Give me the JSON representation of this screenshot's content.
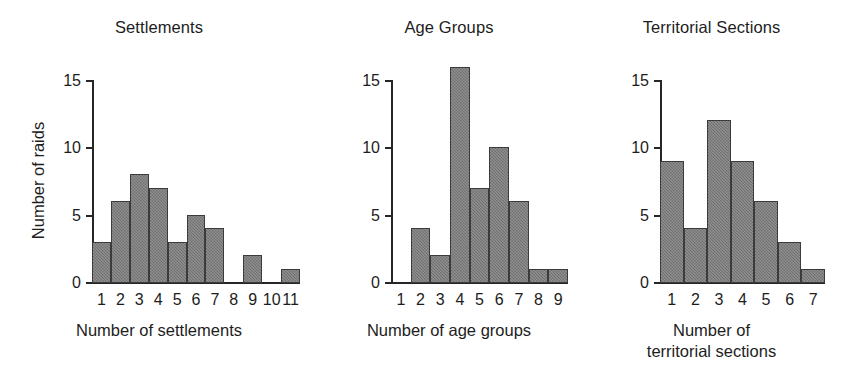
{
  "figure": {
    "background": "#ffffff",
    "bar_fill": "#7b7b7b",
    "bar_stroke": "#3b3b3b",
    "axis_color": "#262626",
    "text_color": "#1d1d1d"
  },
  "chart_data": [
    {
      "type": "bar",
      "title": "Settlements",
      "xlabel": "Number of settlements",
      "ylabel": "Number of raids",
      "categories": [
        "1",
        "2",
        "3",
        "4",
        "5",
        "6",
        "7",
        "8",
        "9",
        "10",
        "11"
      ],
      "values": [
        3,
        6,
        8,
        7,
        3,
        5,
        4,
        0,
        2,
        0,
        1
      ],
      "ylim": [
        0,
        15
      ],
      "yticks": [
        0,
        5,
        10,
        15
      ],
      "ytick_labels": [
        "0",
        "5",
        "10",
        "15"
      ],
      "grid": false,
      "legend": "none"
    },
    {
      "type": "bar",
      "title": "Age Groups",
      "xlabel": "Number of age groups",
      "ylabel": "",
      "categories": [
        "1",
        "2",
        "3",
        "4",
        "5",
        "6",
        "7",
        "8",
        "9"
      ],
      "values": [
        0,
        4,
        2,
        16,
        7,
        10,
        6,
        1,
        1
      ],
      "ylim": [
        0,
        16
      ],
      "yticks": [
        0,
        5,
        10,
        15
      ],
      "ytick_labels": [
        "0",
        "5",
        "10",
        "15"
      ],
      "grid": false,
      "legend": "none"
    },
    {
      "type": "bar",
      "title": "Territorial Sections",
      "xlabel": "Number of\nterritorial sections",
      "xlabel_line1": "Number of",
      "xlabel_line2": "territorial sections",
      "ylabel": "",
      "categories": [
        "1",
        "2",
        "3",
        "4",
        "5",
        "6",
        "7"
      ],
      "values": [
        9,
        4,
        12,
        9,
        6,
        3,
        1
      ],
      "ylim": [
        0,
        15
      ],
      "yticks": [
        0,
        5,
        10,
        15
      ],
      "ytick_labels": [
        "0",
        "5",
        "10",
        "15"
      ],
      "grid": false,
      "legend": "none"
    }
  ]
}
